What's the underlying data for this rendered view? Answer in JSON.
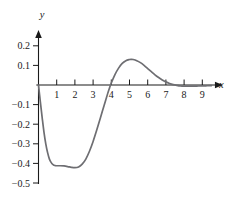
{
  "chart_data": {
    "type": "line",
    "title": "",
    "xlabel": "x",
    "ylabel": "y",
    "xlim": [
      0,
      9.6
    ],
    "ylim": [
      -0.5,
      0.25
    ],
    "grid": false,
    "legend": false,
    "x_ticks": [
      {
        "value": 1,
        "label": "1"
      },
      {
        "value": 2,
        "label": "2"
      },
      {
        "value": 3,
        "label": "3"
      },
      {
        "value": 4,
        "label": "4"
      },
      {
        "value": 5,
        "label": "5"
      },
      {
        "value": 6,
        "label": "6"
      },
      {
        "value": 7,
        "label": "7"
      },
      {
        "value": 8,
        "label": "8"
      },
      {
        "value": 9,
        "label": "9"
      }
    ],
    "y_ticks": [
      {
        "value": 0.2,
        "label": "0.2"
      },
      {
        "value": 0.1,
        "label": "0.1"
      },
      {
        "value": -0.1,
        "label": "−0.1"
      },
      {
        "value": -0.2,
        "label": "−0.2"
      },
      {
        "value": -0.3,
        "label": "−0.3"
      },
      {
        "value": -0.4,
        "label": "−0.4"
      },
      {
        "value": -0.5,
        "label": "−0.5"
      }
    ],
    "curve_color": "#6e6e72",
    "axis_color": "#1a1a1a",
    "series": [
      {
        "name": "curve",
        "x": [
          0.0,
          0.1,
          0.2,
          0.3,
          0.4,
          0.5,
          0.6,
          0.7,
          0.8,
          0.9,
          1.0,
          1.2,
          1.4,
          1.6,
          1.8,
          2.0,
          2.2,
          2.4,
          2.6,
          2.8,
          3.0,
          3.2,
          3.4,
          3.6,
          3.8,
          3.9,
          4.0,
          4.2,
          4.4,
          4.6,
          4.8,
          5.0,
          5.1,
          5.2,
          5.4,
          5.6,
          5.8,
          6.0,
          6.2,
          6.4,
          6.6,
          6.8,
          7.0,
          7.2,
          7.4,
          7.6,
          7.8,
          8.0,
          8.4,
          8.8,
          9.2,
          9.5
        ],
        "y": [
          0.0,
          -0.085,
          -0.165,
          -0.24,
          -0.3,
          -0.345,
          -0.378,
          -0.396,
          -0.406,
          -0.411,
          -0.412,
          -0.412,
          -0.413,
          -0.416,
          -0.42,
          -0.422,
          -0.418,
          -0.404,
          -0.378,
          -0.338,
          -0.288,
          -0.23,
          -0.168,
          -0.106,
          -0.044,
          -0.016,
          0.01,
          0.053,
          0.086,
          0.11,
          0.124,
          0.13,
          0.131,
          0.13,
          0.124,
          0.114,
          0.1,
          0.084,
          0.068,
          0.052,
          0.038,
          0.026,
          0.016,
          0.008,
          0.002,
          -0.002,
          -0.005,
          -0.006,
          -0.006,
          -0.005,
          -0.004,
          -0.003
        ]
      }
    ],
    "annotations": {
      "trough": {
        "x": 2.0,
        "y": -0.42
      },
      "peak": {
        "x": 5.1,
        "y": 0.13
      },
      "zero_crossing": {
        "x": 3.93,
        "y": 0.0
      }
    }
  }
}
